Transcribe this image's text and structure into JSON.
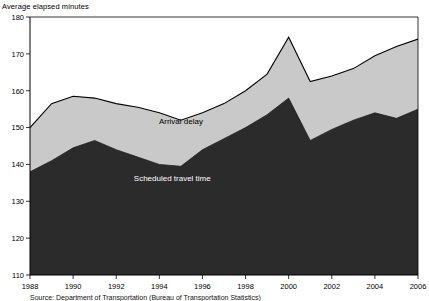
{
  "figure": {
    "y_axis_title": "Average elapsed minutes",
    "source_note": "Source: Department of Transportation (Bureau of Transportation Statistics)"
  },
  "chart_data": {
    "type": "area",
    "stacked": true,
    "title": "",
    "subtitle": "",
    "xlabel": "",
    "ylabel": "Average elapsed minutes",
    "ylim": [
      110,
      180
    ],
    "xlim": [
      1988,
      2006
    ],
    "ytick_labels": [
      "110",
      "120",
      "130",
      "140",
      "150",
      "160",
      "170",
      "180"
    ],
    "yticks": [
      110,
      120,
      130,
      140,
      150,
      160,
      170,
      180
    ],
    "xtick_labels": [
      "1988",
      "1990",
      "1992",
      "1994",
      "1996",
      "1998",
      "2000",
      "2002",
      "2004",
      "2006"
    ],
    "xticks": [
      1988,
      1990,
      1992,
      1994,
      1996,
      1998,
      2000,
      2002,
      2004,
      2006
    ],
    "grid": false,
    "legend": "inline-annotations",
    "x": [
      1988,
      1989,
      1990,
      1991,
      1992,
      1993,
      1994,
      1995,
      1996,
      1997,
      1998,
      1999,
      2000,
      2001,
      2002,
      2003,
      2004,
      2005,
      2006
    ],
    "series": [
      {
        "name": "Scheduled travel time",
        "color": "#2b2b2b",
        "label_color": "#ffffff",
        "values": [
          138.0,
          141.0,
          144.5,
          146.5,
          144.0,
          142.0,
          140.0,
          139.5,
          144.0,
          147.0,
          150.0,
          153.5,
          158.0,
          146.5,
          149.5,
          152.0,
          154.0,
          152.5,
          155.0
        ]
      },
      {
        "name": "Arrival delay",
        "color": "#c9c9c9",
        "label_color": "#000000",
        "values": [
          12.0,
          15.5,
          14.0,
          11.5,
          12.5,
          13.5,
          14.0,
          12.5,
          10.0,
          9.5,
          10.0,
          11.0,
          16.5,
          16.0,
          14.5,
          14.0,
          15.5,
          19.5,
          19.0
        ]
      }
    ],
    "totals": [
      150.0,
      156.5,
      158.5,
      158.0,
      156.5,
      155.5,
      154.0,
      152.0,
      154.0,
      156.5,
      160.0,
      164.5,
      174.5,
      162.5,
      164.0,
      166.0,
      169.5,
      172.0,
      174.0
    ],
    "annotations": [
      {
        "text": "Arrival delay",
        "x": 1995.0,
        "y": 151.0
      },
      {
        "text": "Scheduled travel time",
        "x": 1994.6,
        "y": 135.5
      }
    ]
  }
}
